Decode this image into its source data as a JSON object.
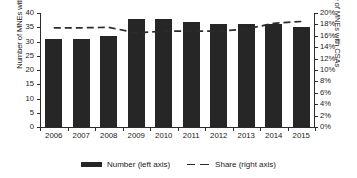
{
  "chart_data": {
    "type": "bar",
    "title": "",
    "subtitle": "",
    "xlabel": "",
    "ylabel": "Number of MNEs with CSA",
    "ylabel_right": "Share of MNEs with CSAs",
    "categories": [
      "2006",
      "2007",
      "2008",
      "2009",
      "2010",
      "2011",
      "2012",
      "2013",
      "2014",
      "2015"
    ],
    "ylim": [
      0,
      40
    ],
    "ylim_right": [
      0,
      20
    ],
    "ytick_labels": [
      "40",
      "35",
      "30",
      "25",
      "20",
      "15",
      "10",
      "5",
      "0"
    ],
    "ytick_values": [
      40,
      35,
      30,
      25,
      20,
      15,
      10,
      5,
      0
    ],
    "ytick_labels_right": [
      "20%",
      "18%",
      "16%",
      "14%",
      "12%",
      "10%",
      "8%",
      "6%",
      "4%",
      "2%",
      "0%"
    ],
    "ytick_values_right": [
      20,
      18,
      16,
      14,
      12,
      10,
      8,
      6,
      4,
      2,
      0
    ],
    "grid": false,
    "legend_position": "bottom",
    "series": [
      {
        "name": "Number (left axis)",
        "kind": "bar",
        "axis": "left",
        "color": "#262626",
        "values": [
          31,
          31,
          32,
          38,
          38,
          37,
          36,
          36,
          36,
          35
        ]
      },
      {
        "name": "Share (right axis)",
        "kind": "line",
        "axis": "right",
        "style": "dashed",
        "color": "#2b2b2b",
        "values": [
          17.4,
          17.4,
          17.5,
          16.5,
          16.8,
          16.8,
          16.8,
          17.2,
          18.2,
          18.5
        ]
      }
    ]
  },
  "legend": {
    "bar_label": "Number (left axis)",
    "line_label": "Share (right axis)"
  }
}
